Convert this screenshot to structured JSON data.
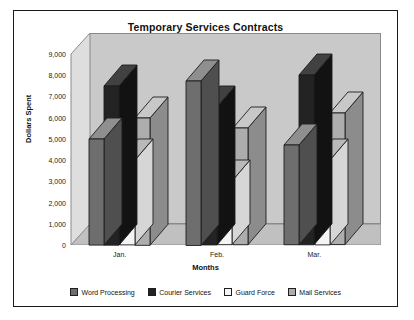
{
  "frame": {
    "border_color": "#1a1a1a",
    "background": "#ffffff"
  },
  "chart_data": {
    "type": "bar",
    "title": "Temporary Services Contracts",
    "xlabel": "Months",
    "ylabel": "Dollars Spent",
    "categories": [
      "Jan.",
      "Feb.",
      "Mar."
    ],
    "ylim": [
      0,
      9000
    ],
    "ytick_labels": [
      "9,000",
      "8,000",
      "7,000",
      "6,000",
      "5,000",
      "4,000",
      "3,000",
      "2,000",
      "1,000",
      "0"
    ],
    "ytick_values": [
      9000,
      8000,
      7000,
      6000,
      5000,
      4000,
      3000,
      2000,
      1000,
      0
    ],
    "grid": false,
    "legend_position": "bottom",
    "style": "3d-column",
    "series": [
      {
        "name": "Word Processing",
        "color": "#6e6e6e",
        "top_color": "#8f8f8f",
        "side_color": "#4f4f4f",
        "values": [
          5000,
          7750,
          4700
        ]
      },
      {
        "name": "Courier Services",
        "color": "#232323",
        "top_color": "#414141",
        "side_color": "#121212",
        "values": [
          7500,
          6500,
          8000
        ]
      },
      {
        "name": "Guard Force",
        "color": "#f4f4f4",
        "top_color": "#b9b9b9",
        "side_color": "#d6d6d6",
        "values": [
          4000,
          3000,
          4000
        ]
      },
      {
        "name": "Mail Services",
        "color": "#adadad",
        "top_color": "#c8c8c8",
        "side_color": "#8c8c8c",
        "values": [
          6000,
          5500,
          6200
        ]
      }
    ]
  },
  "plot": {
    "back_wall_color": "#c9c9c9",
    "left_wall_color": "#dedede",
    "floor_color": "#c0c0c0",
    "axis_line_color": "#8a8a8a"
  }
}
